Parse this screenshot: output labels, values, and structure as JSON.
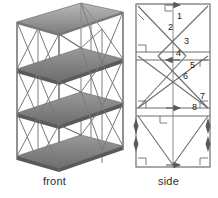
{
  "figure": {
    "title": "",
    "background_color": "#ffffff",
    "line_color": "#6e6e6e",
    "dark_line_color": "#4a4a4a",
    "shelf_fill": "#8d8d8d",
    "shelf_fill_dark": "#6a6a6a",
    "text_color": "#1c1c1c"
  },
  "views": {
    "front": {
      "caption": "front",
      "description": "isometric-rack-front-view",
      "levels": 4,
      "bays": 2
    },
    "side": {
      "caption": "side",
      "description": "side-elevation-bracing-diagram",
      "panels": 3
    }
  },
  "labels": {
    "items": [
      {
        "id": "1",
        "text": "1",
        "x": 41,
        "y": 8
      },
      {
        "id": "2",
        "text": "2",
        "x": 32,
        "y": 19
      },
      {
        "id": "3",
        "text": "3",
        "x": 48,
        "y": 33
      },
      {
        "id": "4",
        "text": "4",
        "x": 40,
        "y": 45
      },
      {
        "id": "5",
        "text": "5",
        "x": 54,
        "y": 57
      },
      {
        "id": "6",
        "text": "6",
        "x": 47,
        "y": 68
      },
      {
        "id": "7",
        "text": "7",
        "x": 78,
        "y": 88
      },
      {
        "id": "8",
        "text": "8",
        "x": 70,
        "y": 99
      }
    ]
  },
  "markers": {
    "right_angle_count": 8,
    "arrow_count": 9,
    "hatch_count": 2
  }
}
